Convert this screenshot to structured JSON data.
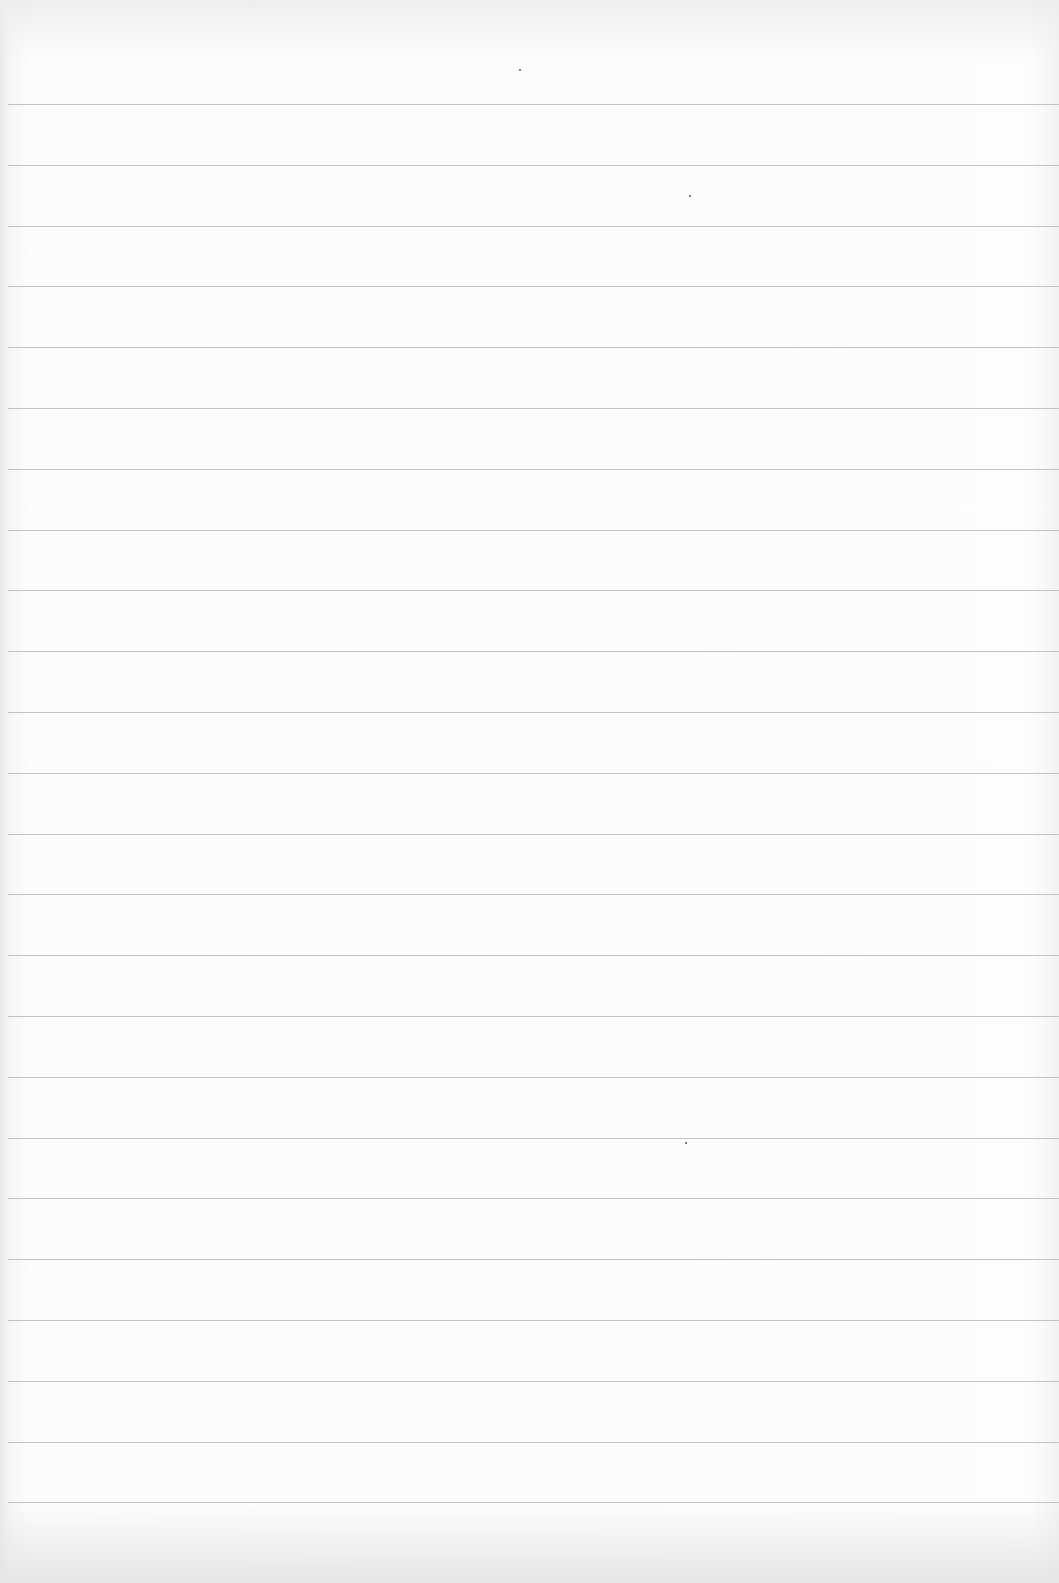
{
  "page": {
    "type": "blank ruled paper",
    "background_color": "#fbfbfb",
    "rule_color": "#b9b9b9",
    "rule_count": 24,
    "first_rule_y": 104,
    "rule_spacing": 60.8
  },
  "specks": [
    {
      "x": 519,
      "y": 69
    },
    {
      "x": 689,
      "y": 195
    },
    {
      "x": 685,
      "y": 1142
    }
  ]
}
